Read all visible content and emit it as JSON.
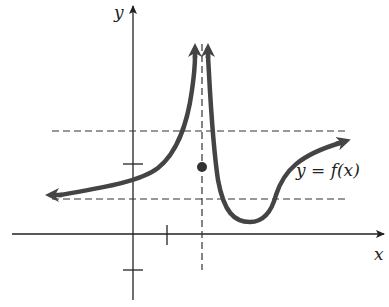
{
  "figure": {
    "type": "function-graph",
    "axes": {
      "x_label": "x",
      "y_label": "y"
    },
    "curve_label": "y = f(x)",
    "features": {
      "vertical_asymptote": "dashed vertical line to the right of the y-axis",
      "horizontal_lines": [
        "upper dashed horizontal line",
        "lower dashed horizontal line"
      ],
      "isolated_point": "solid dot on the vertical asymptote between the two dashed lines",
      "left_branch": "approaches lower dashed line as x → -∞, rises to +∞ approaching the asymptote from the left",
      "right_branch": "descends from +∞ right of the asymptote, dips below lower line to a minimum above the x-axis, rises and approaches the upper dashed line as x → +∞"
    },
    "ticks": {
      "x_ticks": 1,
      "y_ticks": 2
    },
    "colors": {
      "curve": "#444444",
      "axes": "#222222",
      "dashed": "#333333",
      "background": "#ffffff"
    }
  }
}
